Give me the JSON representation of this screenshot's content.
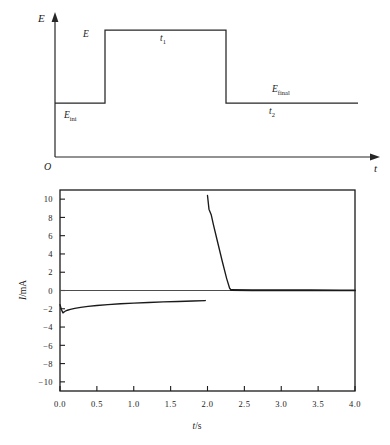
{
  "figure": {
    "panels": [
      {
        "id": "potential-waveform",
        "type": "step-waveform",
        "y_axis_label": "E",
        "x_axis_label": "t",
        "origin_label": "O",
        "annotations": [
          {
            "name": "step-amplitude",
            "text": "E",
            "sub": ""
          },
          {
            "name": "initial-potential",
            "text": "E",
            "sub": "ini"
          },
          {
            "name": "final-potential",
            "text": "E",
            "sub": "final"
          },
          {
            "name": "pulse-duration",
            "text": "t",
            "sub": "1"
          },
          {
            "name": "relaxation-duration",
            "text": "t",
            "sub": "2"
          }
        ]
      },
      {
        "id": "current-response",
        "type": "line"
      }
    ]
  },
  "chart_data": [
    {
      "type": "line",
      "name": "potential-step-waveform",
      "title": "",
      "xlabel": "t",
      "ylabel": "E",
      "grid": false,
      "legend": "none",
      "axes_style": "arrow",
      "origin_label": "O",
      "xlim": [
        0,
        4.0
      ],
      "ylim": [
        0,
        1.0
      ],
      "annotations": [
        {
          "label": "E",
          "x": 0.62,
          "y": 0.78,
          "note": "step amplitude marker at rising edge"
        },
        {
          "label": "E_ini",
          "x": 0.35,
          "y": 0.33,
          "note": "initial potential baseline"
        },
        {
          "label": "t_1",
          "x": 1.62,
          "y": 0.8,
          "note": "pulse width of elevated potential"
        },
        {
          "label": "E_final",
          "x": 3.05,
          "y": 0.56,
          "note": "final potential baseline"
        },
        {
          "label": "t_2",
          "x": 3.02,
          "y": 0.33,
          "note": "duration after step down"
        }
      ],
      "series": [
        {
          "name": "E(t)",
          "color": "#262626",
          "x": [
            0.0,
            0.74,
            0.74,
            1.95,
            1.95,
            4.0
          ],
          "values": [
            0.45,
            0.45,
            0.9,
            0.9,
            0.45,
            0.45
          ]
        }
      ]
    },
    {
      "type": "line",
      "name": "current-response",
      "title": "",
      "xlabel": "t/s",
      "ylabel": "I/mA",
      "grid": false,
      "legend": "none",
      "axes_style": "box",
      "xlim": [
        0.0,
        4.0
      ],
      "ylim": [
        -11.0,
        11.0
      ],
      "xticks": [
        "0.0",
        "0.5",
        "1.0",
        "1.5",
        "2.0",
        "2.5",
        "3.0",
        "3.5",
        "4.0"
      ],
      "xtick_values": [
        0.0,
        0.5,
        1.0,
        1.5,
        2.0,
        2.5,
        3.0,
        3.5,
        4.0
      ],
      "yticks": [
        "10",
        "8",
        "6",
        "4",
        "2",
        "0",
        "−2",
        "−4",
        "−6",
        "−8",
        "−10"
      ],
      "ytick_values": [
        10,
        8,
        6,
        4,
        2,
        0,
        -2,
        -4,
        -6,
        -8,
        -10
      ],
      "zero_line": 0,
      "series": [
        {
          "name": "cathodic-branch",
          "color": "#1a1a1a",
          "x": [
            0.0,
            0.02,
            0.04,
            0.06,
            0.08,
            0.1,
            0.14,
            0.2,
            0.28,
            0.38,
            0.5,
            0.65,
            0.82,
            1.0,
            1.2,
            1.4,
            1.6,
            1.8,
            1.97
          ],
          "values": [
            -1.55,
            -2.1,
            -2.45,
            -2.32,
            -2.22,
            -2.16,
            -2.07,
            -1.96,
            -1.85,
            -1.74,
            -1.64,
            -1.54,
            -1.45,
            -1.38,
            -1.31,
            -1.25,
            -1.2,
            -1.15,
            -1.1
          ]
        },
        {
          "name": "anodic-spike",
          "color": "#1a1a1a",
          "x": [
            2.0,
            2.02,
            2.05,
            2.08,
            2.14,
            2.2,
            2.26,
            2.3,
            2.32
          ],
          "values": [
            10.4,
            8.9,
            8.3,
            7.2,
            5.2,
            3.2,
            1.3,
            0.25,
            0.05
          ]
        },
        {
          "name": "anodic-baseline",
          "color": "#1a1a1a",
          "x": [
            2.32,
            2.6,
            3.0,
            3.4,
            3.8,
            4.0
          ],
          "values": [
            0.05,
            0.03,
            0.02,
            0.02,
            0.01,
            0.01
          ]
        }
      ]
    }
  ]
}
